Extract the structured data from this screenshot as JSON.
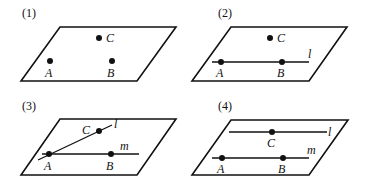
{
  "panels": [
    {
      "id": "1",
      "label": "(1)",
      "points": {
        "A": "A",
        "B": "B",
        "C": "C"
      },
      "lines": {}
    },
    {
      "id": "2",
      "label": "(2)",
      "points": {
        "A": "A",
        "B": "B",
        "C": "C"
      },
      "lines": {
        "l": "l"
      }
    },
    {
      "id": "3",
      "label": "(3)",
      "points": {
        "A": "A",
        "B": "B",
        "C": "C"
      },
      "lines": {
        "l": "l",
        "m": "m"
      }
    },
    {
      "id": "4",
      "label": "(4)",
      "points": {
        "A": "A",
        "B": "B",
        "C": "C"
      },
      "lines": {
        "l": "l",
        "m": "m"
      }
    }
  ]
}
